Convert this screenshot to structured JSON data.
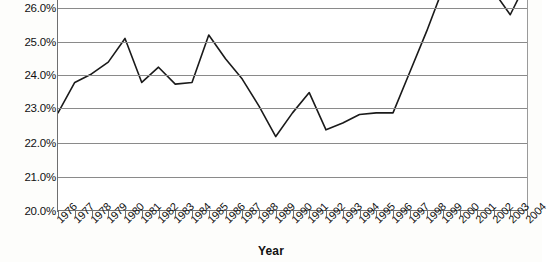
{
  "chart_data": {
    "type": "line",
    "title": "",
    "xlabel": "Year",
    "ylabel": "",
    "categories": [
      "1976",
      "1977",
      "1978",
      "1979",
      "1980",
      "1981",
      "1982",
      "1983",
      "1984",
      "1985",
      "1986",
      "1987",
      "1988",
      "1989",
      "1990",
      "1991",
      "1992",
      "1993",
      "1994",
      "1995",
      "1996",
      "1997",
      "1998",
      "1999",
      "2000",
      "2001",
      "2002",
      "2003",
      "2004"
    ],
    "values": [
      22.9,
      23.8,
      24.05,
      24.4,
      25.1,
      23.8,
      24.25,
      23.75,
      23.8,
      25.2,
      24.5,
      23.9,
      23.1,
      22.2,
      22.9,
      23.5,
      22.4,
      22.6,
      22.85,
      22.9,
      22.9,
      24.1,
      25.3,
      26.6,
      26.9,
      26.8,
      26.5,
      25.8,
      26.8
    ],
    "series": [
      {
        "name": "",
        "values": [
          22.9,
          23.8,
          24.05,
          24.4,
          25.1,
          23.8,
          24.25,
          23.75,
          23.8,
          25.2,
          24.5,
          23.9,
          23.1,
          22.2,
          22.9,
          23.5,
          22.4,
          22.6,
          22.85,
          22.9,
          22.9,
          24.1,
          25.3,
          26.6,
          26.9,
          26.8,
          26.5,
          25.8,
          26.8
        ]
      }
    ],
    "ytick_labels": [
      "26.0%",
      "25.0%",
      "24.0%",
      "23.0%",
      "22.0%",
      "21.0%",
      "20.0%"
    ],
    "ytick_values": [
      26.0,
      25.0,
      24.0,
      23.0,
      22.0,
      21.0,
      20.0
    ],
    "ylim": [
      20.0,
      26.0
    ],
    "xlim": [
      "1976",
      "2004"
    ],
    "grid": true,
    "legend": "none",
    "note_cropped_top": "line extends above the visible 26.0% gridline between 1999 and 2004",
    "colors": {
      "line": "#1a1a1a",
      "grid": "#8a8a8a",
      "axis": "#6f6f6f",
      "plot_background": "#ffffff",
      "figure_background": "#fdfdfb",
      "text": "#111111"
    }
  },
  "axis": {
    "x_title": "Year"
  }
}
